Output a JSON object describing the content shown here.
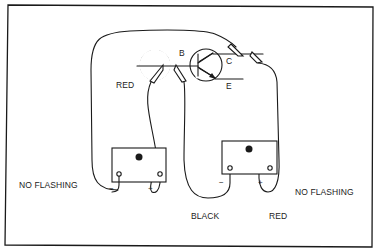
{
  "diagram": {
    "type": "transistor-test-circuit",
    "transistor": {
      "terminals": {
        "base": "B",
        "collector": "C",
        "emitter": "E"
      }
    },
    "labels": {
      "red_left": "RED",
      "no_flashing_left": "NO FLASHING",
      "no_flashing_right": "NO FLASHING",
      "black": "BLACK",
      "red_bottom": "RED"
    },
    "batteries": [
      {
        "name": "left-battery",
        "minus": "−",
        "plus": "+"
      },
      {
        "name": "right-battery",
        "minus": "−",
        "plus": "+"
      }
    ],
    "colors": {
      "line": "#1a1a1a",
      "background": "#ffffff"
    }
  }
}
